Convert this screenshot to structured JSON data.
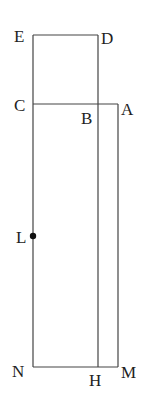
{
  "diagram": {
    "type": "geometry-figure",
    "colors": {
      "line": "#444444",
      "text": "#222222",
      "background": "#ffffff"
    },
    "points": {
      "E": {
        "label": "E",
        "x": 33,
        "y": 35
      },
      "D": {
        "label": "D",
        "x": 98,
        "y": 35
      },
      "C": {
        "label": "C",
        "x": 33,
        "y": 104
      },
      "B": {
        "label": "B",
        "x": 98,
        "y": 104
      },
      "A": {
        "label": "A",
        "x": 118,
        "y": 104
      },
      "L": {
        "label": "L",
        "x": 33,
        "y": 236
      },
      "N": {
        "label": "N",
        "x": 33,
        "y": 367
      },
      "H": {
        "label": "H",
        "x": 98,
        "y": 367
      },
      "M": {
        "label": "M",
        "x": 118,
        "y": 367
      }
    },
    "segments": [
      [
        "E",
        "D"
      ],
      [
        "E",
        "N"
      ],
      [
        "D",
        "H"
      ],
      [
        "C",
        "A"
      ],
      [
        "A",
        "M"
      ],
      [
        "N",
        "M"
      ]
    ],
    "marked_points": [
      "L"
    ]
  }
}
